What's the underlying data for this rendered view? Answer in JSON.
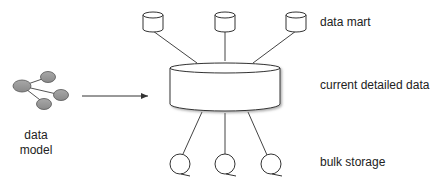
{
  "labels": {
    "data_mart": "data mart",
    "current_detailed_data": "current detailed data",
    "bulk_storage": "bulk storage",
    "data_model_line1": "data",
    "data_model_line2": "model"
  },
  "colors": {
    "node_fill": "#999999",
    "stroke": "#333333",
    "text": "#222222"
  }
}
